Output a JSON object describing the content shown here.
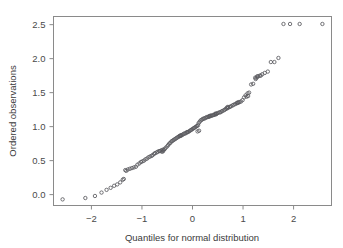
{
  "chart_data": {
    "type": "scatter",
    "title": "",
    "xlabel": "Quantiles for normal distribution",
    "ylabel": "Ordered observations",
    "xlim": [
      -2.75,
      2.75
    ],
    "ylim": [
      -0.16,
      2.62
    ],
    "xticks": [
      -2,
      -1,
      0,
      1,
      2
    ],
    "xticklabels": [
      "−2",
      "−1",
      "0",
      "1",
      "2"
    ],
    "yticks": [
      0.0,
      0.5,
      1.0,
      1.5,
      2.0,
      2.5
    ],
    "yticklabels": [
      "0.0",
      "0.5",
      "1.0",
      "1.5",
      "2.0",
      "2.5"
    ],
    "grid": false,
    "legend": null,
    "marker": "open-circle",
    "marker_color": "#5a5a5f",
    "frame_color": "#8a8a8a",
    "n_points": 150,
    "x": [
      -2.57,
      -2.12,
      -1.93,
      -1.8,
      -1.7,
      -1.62,
      -1.55,
      -1.49,
      -1.43,
      -1.38,
      -1.33,
      -1.28,
      -1.24,
      -1.2,
      -1.16,
      -1.12,
      -1.09,
      -1.05,
      -1.02,
      -0.99,
      -0.96,
      -0.93,
      -0.9,
      -0.87,
      -0.84,
      -0.81,
      -0.79,
      -0.76,
      -0.74,
      -0.71,
      -0.69,
      -0.66,
      -0.64,
      -0.62,
      -0.59,
      -0.57,
      -0.55,
      -0.53,
      -0.5,
      -0.48,
      -0.46,
      -0.44,
      -0.42,
      -0.4,
      -0.38,
      -0.36,
      -0.34,
      -0.32,
      -0.3,
      -0.28,
      -0.26,
      -0.24,
      -0.22,
      -0.2,
      -0.18,
      -0.16,
      -0.14,
      -0.12,
      -0.11,
      -0.09,
      -0.07,
      -0.05,
      -0.03,
      -0.01,
      0.01,
      0.03,
      0.05,
      0.07,
      0.09,
      0.11,
      0.12,
      0.14,
      0.16,
      0.18,
      0.2,
      0.22,
      0.24,
      0.26,
      0.28,
      0.3,
      0.32,
      0.34,
      0.36,
      0.38,
      0.4,
      0.42,
      0.44,
      0.46,
      0.48,
      0.5,
      0.53,
      0.55,
      0.57,
      0.59,
      0.62,
      0.64,
      0.66,
      0.69,
      0.71,
      0.74,
      0.76,
      0.79,
      0.81,
      0.84,
      0.87,
      0.9,
      0.93,
      0.96,
      0.99,
      1.02,
      1.05,
      1.09,
      1.12,
      1.16,
      1.2,
      1.24,
      1.28,
      1.33,
      1.38,
      1.43,
      1.49,
      1.55,
      1.62,
      1.7,
      1.8,
      1.93,
      2.12,
      2.57,
      -1.36,
      -1.31,
      -0.6,
      -0.58,
      0.1,
      0.13,
      0.45,
      0.47,
      0.88,
      0.91,
      1.3,
      1.35,
      -0.25,
      -0.23,
      0.33,
      0.35,
      0.68,
      0.7,
      1.07,
      1.1,
      1.25,
      1.27
    ],
    "y": [
      -0.07,
      -0.05,
      -0.02,
      0.03,
      0.07,
      0.1,
      0.13,
      0.15,
      0.18,
      0.22,
      0.36,
      0.37,
      0.38,
      0.39,
      0.4,
      0.41,
      0.44,
      0.46,
      0.48,
      0.49,
      0.5,
      0.52,
      0.53,
      0.55,
      0.56,
      0.57,
      0.58,
      0.6,
      0.61,
      0.62,
      0.63,
      0.64,
      0.64,
      0.65,
      0.66,
      0.66,
      0.67,
      0.69,
      0.71,
      0.73,
      0.75,
      0.76,
      0.78,
      0.79,
      0.8,
      0.81,
      0.82,
      0.83,
      0.84,
      0.85,
      0.86,
      0.87,
      0.87,
      0.88,
      0.89,
      0.9,
      0.9,
      0.91,
      0.92,
      0.92,
      0.93,
      0.94,
      0.95,
      0.96,
      0.97,
      0.98,
      0.99,
      1.0,
      1.01,
      1.02,
      1.05,
      1.07,
      1.09,
      1.1,
      1.11,
      1.12,
      1.12,
      1.13,
      1.14,
      1.14,
      1.15,
      1.15,
      1.16,
      1.16,
      1.17,
      1.17,
      1.18,
      1.18,
      1.19,
      1.2,
      1.21,
      1.21,
      1.22,
      1.23,
      1.24,
      1.25,
      1.26,
      1.27,
      1.28,
      1.29,
      1.3,
      1.31,
      1.32,
      1.33,
      1.34,
      1.35,
      1.36,
      1.37,
      1.39,
      1.43,
      1.46,
      1.49,
      1.5,
      1.62,
      1.63,
      1.72,
      1.74,
      1.75,
      1.77,
      1.79,
      1.81,
      1.95,
      1.95,
      2.01,
      2.51,
      2.51,
      2.51,
      2.51,
      0.23,
      0.35,
      0.63,
      0.64,
      0.93,
      0.94,
      1.19,
      1.19,
      1.35,
      1.36,
      1.74,
      1.75,
      0.86,
      0.87,
      1.15,
      1.16,
      1.28,
      1.29,
      1.44,
      1.45,
      1.7,
      1.72
    ]
  }
}
